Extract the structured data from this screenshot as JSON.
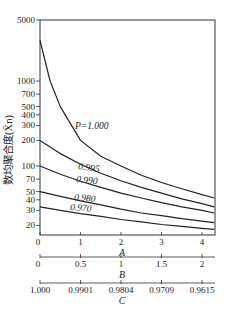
{
  "chart_data": {
    "type": "line",
    "title": "",
    "ylabel": "数均聚合度(X̄n)",
    "yscale": "log",
    "ylim": [
      17,
      5000
    ],
    "yticks": [
      5000,
      1000,
      700,
      500,
      400,
      300,
      200,
      100,
      70,
      50,
      40,
      30,
      20
    ],
    "ytick_labels": [
      "5000",
      "1000",
      "700",
      "500",
      "400",
      "300",
      "200",
      "100",
      "70",
      "50",
      "40",
      "30",
      "20"
    ],
    "x_axes": [
      {
        "name": "A",
        "ticks": [
          "0",
          "1",
          "2",
          "3",
          "4"
        ],
        "positions": [
          0,
          1,
          2,
          3,
          4
        ]
      },
      {
        "name": "B",
        "ticks": [
          "0",
          "0.5",
          "1",
          "1.5",
          "2"
        ],
        "positions": [
          0,
          1,
          2,
          3,
          4
        ]
      },
      {
        "name": "C",
        "ticks": [
          "1.000",
          "0.9901",
          "0.9804",
          "0.9709",
          "0.9615"
        ],
        "positions": [
          0,
          1,
          2,
          3,
          4
        ]
      }
    ],
    "xlim": [
      0,
      4.3
    ],
    "series": [
      {
        "name": "P=1.000",
        "label": "P=1.000",
        "x": [
          0,
          0.25,
          0.5,
          1,
          1.5,
          2,
          2.5,
          3,
          3.5,
          4,
          4.3
        ],
        "values": [
          3000,
          1000,
          500,
          200,
          130,
          100,
          78,
          64,
          54,
          46,
          42
        ]
      },
      {
        "name": "0.995",
        "label": "0.995",
        "x": [
          0,
          0.5,
          1,
          1.5,
          2,
          2.5,
          3,
          3.5,
          4,
          4.3
        ],
        "values": [
          200,
          140,
          105,
          82,
          67,
          56,
          48,
          41,
          36,
          33
        ]
      },
      {
        "name": "0.990",
        "label": "0.990",
        "x": [
          0,
          0.5,
          1,
          1.5,
          2,
          2.5,
          3,
          3.5,
          4,
          4.3
        ],
        "values": [
          100,
          80,
          66,
          56,
          48,
          42,
          37,
          33,
          30,
          28
        ]
      },
      {
        "name": "0.980",
        "label": "0.980",
        "x": [
          0,
          0.5,
          1,
          1.5,
          2,
          2.5,
          3,
          3.5,
          4,
          4.3
        ],
        "values": [
          50,
          44,
          39,
          35,
          31,
          28,
          26,
          24,
          22.5,
          21.5
        ]
      },
      {
        "name": "0.970",
        "label": "0.970",
        "x": [
          0,
          0.5,
          1,
          1.5,
          2,
          2.5,
          3,
          3.5,
          4,
          4.3
        ],
        "values": [
          33,
          30,
          27.5,
          25.5,
          23.5,
          22,
          20.5,
          19.5,
          18.5,
          18
        ]
      }
    ],
    "grid": false,
    "legend": "inline labels on curves"
  },
  "labels": {
    "ylabel": "数均聚合度(X̄n)",
    "axis_a": "A",
    "axis_b": "B",
    "axis_c": "C",
    "curve_p1": "P=1.000",
    "curve_995": "0.995",
    "curve_990": "0.990",
    "curve_980": "0.980",
    "curve_970": "0.970"
  }
}
